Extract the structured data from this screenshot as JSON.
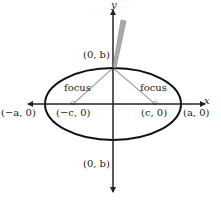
{
  "diagram": {
    "type": "ellipse-foci",
    "axes": {
      "x_label": "x",
      "y_label": "y"
    },
    "labels": {
      "top_vertex": "(0, b)",
      "bottom_vertex": "(0, b)",
      "left_vertex": "(−a, 0)",
      "right_vertex": "(a, 0)",
      "left_focus_point": "(−c, 0)",
      "right_focus_point": "(c, 0)",
      "left_focus_word": "focus",
      "right_focus_word": "focus"
    },
    "colors": {
      "ellipse": "#111111",
      "axes": "#222222",
      "string": "#aaaaaa",
      "pencil": "#999999"
    }
  }
}
